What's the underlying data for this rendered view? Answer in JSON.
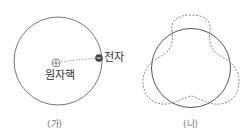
{
  "panels": {
    "a": {
      "caption": "(가)",
      "nucleus_label": "원자핵",
      "electron_label": "전자",
      "nucleus_icon": "plus-circle",
      "electron_icon": "minus-circle"
    },
    "b": {
      "caption": "(나)",
      "solid_shape": "circle-orbit",
      "dashed_shape": "standing-wave-3-lobes"
    }
  },
  "colors": {
    "stroke": "#555555",
    "dashed": "#777777",
    "electron": "#444444",
    "text": "#333333"
  }
}
